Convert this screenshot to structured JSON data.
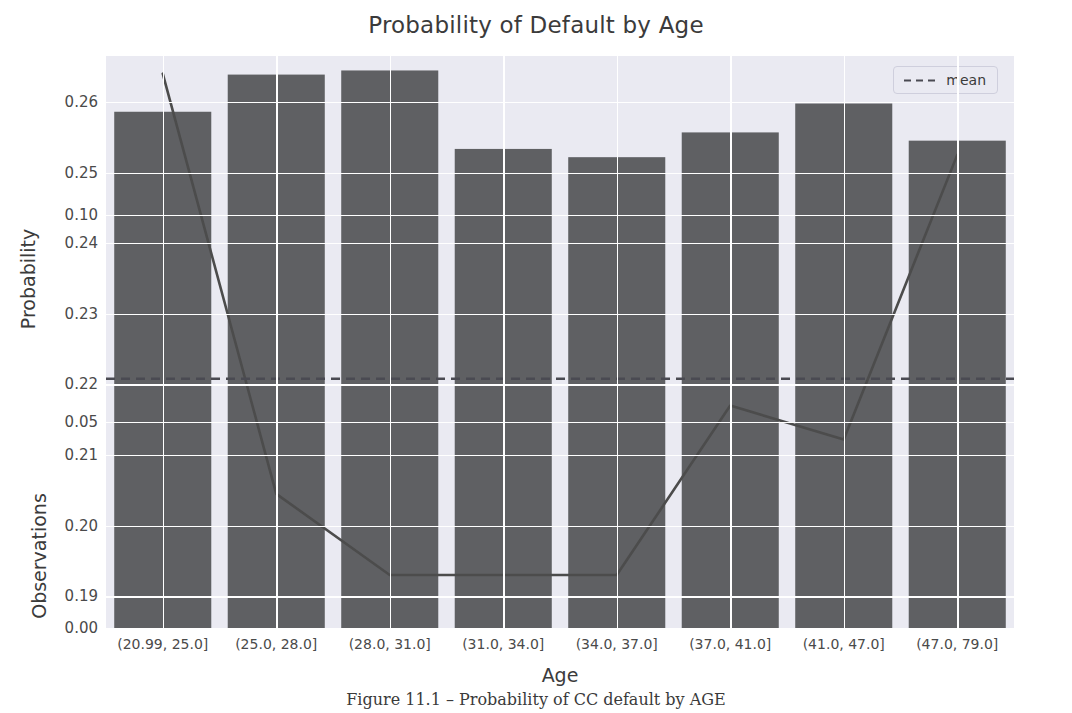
{
  "chart_data": {
    "type": "line",
    "title": "Probability of Default by Age",
    "xlabel": "Age",
    "ylabel": "Probability",
    "ylabel_secondary": "Observations",
    "grid": true,
    "legend_position": "upper right",
    "categories": [
      "(20.99, 25.0]",
      "(25.0, 28.0]",
      "(28.0, 31.0]",
      "(31.0, 34.0]",
      "(34.0, 37.0]",
      "(37.0, 41.0]",
      "(41.0, 47.0]",
      "(47.0, 79.0]"
    ],
    "series": [
      {
        "name": "probability",
        "type": "line",
        "axis": "left",
        "values": [
          0.264,
          0.2045,
          0.193,
          0.193,
          0.193,
          0.217,
          0.2122,
          0.2525
        ]
      },
      {
        "name": "observations",
        "type": "bar",
        "axis": "right",
        "values": [
          0.125,
          0.134,
          0.135,
          0.116,
          0.114,
          0.12,
          0.127,
          0.118
        ]
      }
    ],
    "reference_lines": [
      {
        "name": "mean",
        "value": 0.2208,
        "style": "dashed",
        "axis": "left"
      }
    ],
    "yticks_primary": [
      "0.26",
      "0.25",
      "0.24",
      "0.23",
      "0.22",
      "0.21",
      "0.20",
      "0.19"
    ],
    "yticks_primary_values": [
      0.26,
      0.25,
      0.24,
      0.23,
      0.22,
      0.21,
      0.2,
      0.19
    ],
    "yticks_secondary": [
      "0.10",
      "0.05",
      "0.00"
    ],
    "yticks_secondary_values": [
      0.1,
      0.05,
      0.0
    ],
    "ylim_primary": [
      0.1855,
      0.2665
    ],
    "ylim_secondary": [
      0.0,
      0.1385
    ],
    "colors": {
      "line": "#4c4c4c",
      "mean_line": "#4a4a52",
      "bar": "#5f6063",
      "plot_background": "#eaeaf2",
      "grid": "#ffffff",
      "text": "#3b3b3b"
    }
  },
  "legend": {
    "label": "mean"
  },
  "caption": {
    "text": "Figure 11.1 – Probability of CC default by AGE"
  }
}
